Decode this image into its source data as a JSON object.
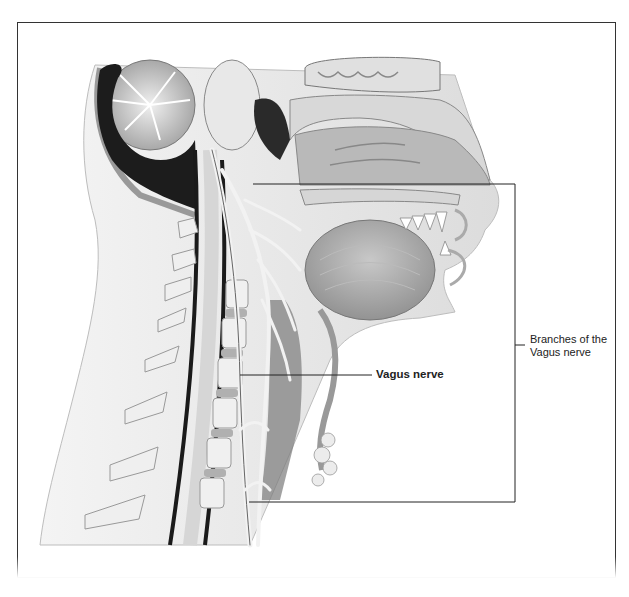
{
  "figure": {
    "labels": {
      "vagus_nerve": "Vagus nerve",
      "branches_line1": "Branches of the",
      "branches_line2": "Vagus nerve"
    },
    "colors": {
      "frame": "#333333",
      "leader_line": "#222222",
      "tissue_light": "#e6e6e6",
      "tissue_mid": "#a8a8a8",
      "tissue_dark": "#1a1a1a"
    }
  }
}
